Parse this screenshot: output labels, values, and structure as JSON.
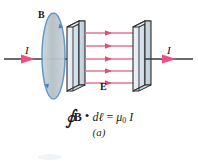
{
  "figure": {
    "panel_label": "(a)",
    "labels": {
      "b_field": "B",
      "e_field": "E",
      "current_left": "I",
      "current_right": "I"
    },
    "equation": {
      "integral_sign": "∮",
      "field_symbol": "B",
      "dot": "•",
      "differential": "dℓ",
      "equals": "=",
      "mu": "μ",
      "mu_subscript": "0",
      "current": "I",
      "plain_text": "∮ B • dℓ = μ0 I"
    },
    "colors": {
      "field_arrow": "#e8738f",
      "field_arrow_dark": "#d9517a",
      "current_arrow": "#ef4d86",
      "wire": "#3a3a3a",
      "plate_face": "#dde7ee",
      "plate_edge": "#2a2a2a",
      "loop_fill": "#b9c4c9",
      "loop_stroke": "#5b93c4",
      "text": "#141414",
      "background": "#ffffff"
    },
    "elements": {
      "amperian_loop": "ellipse",
      "capacitor_plates": 2,
      "e_field_arrow_count": 5,
      "wire_segments": 2
    }
  }
}
